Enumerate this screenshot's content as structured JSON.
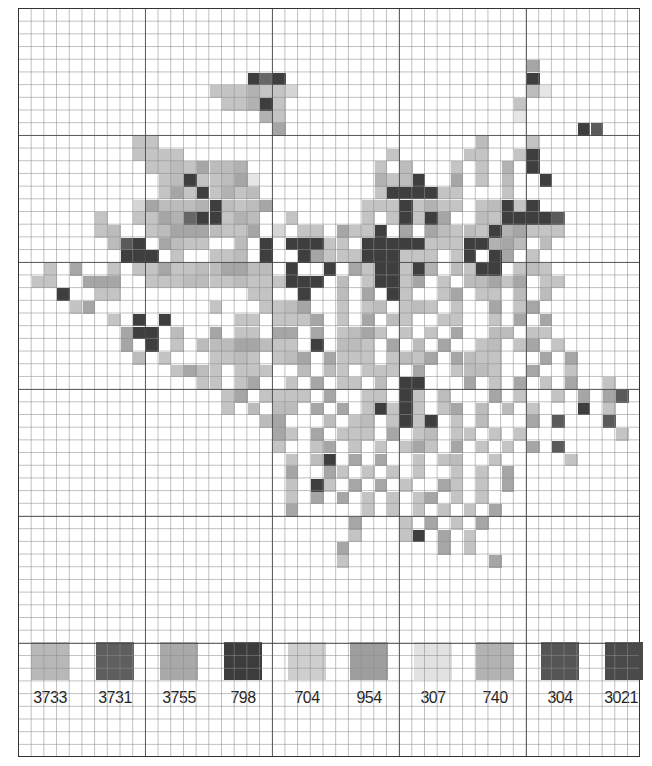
{
  "chart_data": {
    "type": "heatmap",
    "title": "",
    "grid": {
      "columns": 49,
      "rows": 59,
      "major_every": 10,
      "gridlines": true
    },
    "shade_key": {
      ".": "empty",
      "1": "307",
      "2": "704",
      "3": "3733",
      "4": "740",
      "5": "954",
      "6": "3755",
      "7": "3731",
      "8": "304",
      "9": "798",
      "0": "3021"
    },
    "rows": [
      ".................................................",
      ".................................................",
      ".................................................",
      ".................................................",
      "........................................5........",
      "..................979...................9........",
      "...............3336332..................41.......",
      "................33693..................3.........",
      "...................63..................1.........",
      "....................5.......................98...",
      ".........33.........................4...3........",
      ".........3333................3.....33..39........",
      "..........33435446..........3.4...3.3.6.9........",
      "...........34933451.........6349..5.3.4..9.......",
      "...........35393634.........3999933...3..........",
      ".........25444694345.......33393633.34939........",
      "......3..3356799364..3.....3.39395..4399998......",
      "......34..345554335.2.33.5339.5.54343965333......",
      ".......489.5433..4.9.99933.9999933399654.4.......",
      "........999.3..334.9..95333999333.39.95.3........",
      "..3.5..3.33533445544.9..9.5399396.4399.343.......",
      ".33..555..33344334333999.4.39935.3.44535.33......",
      "...9..33..........33..9..4.5.93..35.33.4.4.......",
      "....35.........3...3345..3.34.343.3..5.35........",
      ".......3.9.9.....33.3335.3.5.43..33..3.5.5.......",
      "........599.4..5.33.55.5.3453.3.3.5..44.33.......",
      "........5.9.3.44455433.9.443.5.4.5..34.35.3......",
      ".........4.3...3343.345.5333.3435.5433...5.5.....",
      "............3543.333..4.43.333.5..3443..5..3.....",
      "..............33.35..3.5.33.4.99...5.3.5.3.5..3..",
      "................35.3333.5..33.93.4...5.3..3.5.58.",
      "................3.4.44.5.5.39393.35.4.4.3...9.3..",
      "...................45...4.34.3939.3.4...5.8...8..",
      "....................53.5.333.5.34.33.3.3.......3.",
      "....................3..35.3.3.353.5.3.3.5.8.....",
      ".....................3.49.5.5..3.34..3.....3.....",
      ".....................5..53.3.3.3..3.3.5...........",
      ".....................3.93.5.5.3..53.3.5..........",
      ".....................3.5.5.3.3.35.3.3............",
      ".....................5.....3.3.3.3.3.5...........",
      "..........................5...3.5.3.5............",
      "..........................3...39.5.3.............",
      ".........................5.......5.3.............",
      ".........................3...........5...........",
      ".................................................",
      ".................................................",
      ".................................................",
      ".................................................",
      ".................................................",
      ".................................................",
      "................................................."
    ],
    "legend": [
      {
        "code": "3733",
        "color": "#b8b8b8"
      },
      {
        "code": "3731",
        "color": "#5e5e5e"
      },
      {
        "code": "3755",
        "color": "#a9a9a9"
      },
      {
        "code": "798",
        "color": "#3c3c3c"
      },
      {
        "code": "704",
        "color": "#cfcfcf"
      },
      {
        "code": "954",
        "color": "#9e9e9e"
      },
      {
        "code": "307",
        "color": "#e2e2e2"
      },
      {
        "code": "740",
        "color": "#b3b3b3"
      },
      {
        "code": "304",
        "color": "#555555"
      },
      {
        "code": "3021",
        "color": "#4a4a4a"
      }
    ],
    "xlabel": "",
    "ylabel": ""
  },
  "palette": {
    "1": "#e6e6e6",
    "2": "#d6d6d6",
    "3": "#c4c4c4",
    "4": "#bcbcbc",
    "5": "#a6a6a6",
    "6": "#b2b2b2",
    "7": "#666666",
    "8": "#5a5a5a",
    "9": "#3e3e3e",
    "0": "#4c4c4c"
  },
  "legend_labels": [
    "3733",
    "3731",
    "3755",
    "798",
    "704",
    "954",
    "307",
    "740",
    "304",
    "3021"
  ]
}
